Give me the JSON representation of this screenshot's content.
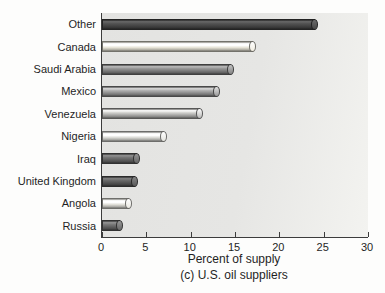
{
  "chart_data": {
    "type": "bar",
    "orientation": "horizontal",
    "title": "",
    "categories": [
      "Other",
      "Canada",
      "Saudi Arabia",
      "Mexico",
      "Venezuela",
      "Nigeria",
      "Iraq",
      "United Kingdom",
      "Angola",
      "Russia"
    ],
    "values": [
      24,
      17,
      14.5,
      13,
      11,
      7,
      4,
      3.7,
      3,
      2
    ],
    "bar_colors": [
      "#454545",
      "#e6e3d6",
      "#7d7d7d",
      "#929292",
      "#b0b0ae",
      "#dadad5",
      "#616161",
      "#565656",
      "#deddd6",
      "#636363"
    ],
    "xlabel": "Percent of supply",
    "caption": "(c) U.S. oil suppliers",
    "xlim": [
      0,
      30
    ],
    "xticks": [
      0,
      5,
      10,
      15,
      20,
      25,
      30
    ],
    "grid": false,
    "legend": false,
    "plot_background": "#e5e5e3",
    "axis_color": "#3c3c3c",
    "text_color": "#1f1f1f"
  }
}
